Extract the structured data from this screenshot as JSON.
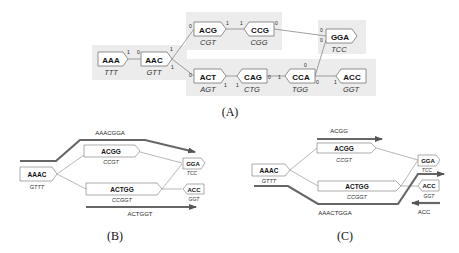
{
  "panel_a": {
    "caption": "(A)",
    "nodes": [
      {
        "id": "AAA",
        "label": "AAA",
        "sub": "TTT",
        "x": 98,
        "y": 52,
        "dir": "right"
      },
      {
        "id": "AAC",
        "label": "AAC",
        "sub": "GTT",
        "x": 141,
        "y": 52,
        "dir": "right"
      },
      {
        "id": "ACG",
        "label": "ACG",
        "sub": "CGT",
        "x": 194,
        "y": 22,
        "dir": "right"
      },
      {
        "id": "CCG",
        "label": "CCG",
        "sub": "CGG",
        "x": 244,
        "y": 22,
        "dir": "left"
      },
      {
        "id": "GGA",
        "label": "GGA",
        "sub": "TCC",
        "x": 326,
        "y": 29,
        "dir": "right"
      },
      {
        "id": "ACT",
        "label": "ACT",
        "sub": "AGT",
        "x": 194,
        "y": 69,
        "dir": "right"
      },
      {
        "id": "CAG",
        "label": "CAG",
        "sub": "CTG",
        "x": 237,
        "y": 69,
        "dir": "left"
      },
      {
        "id": "CCA",
        "label": "CCA",
        "sub": "TGG",
        "x": 285,
        "y": 69,
        "dir": "left"
      },
      {
        "id": "ACC",
        "label": "ACC",
        "sub": "GGT",
        "x": 336,
        "y": 69,
        "dir": "left"
      }
    ],
    "port_labels": [
      "1",
      "0",
      "1",
      "1",
      "0",
      "1",
      "1",
      "0",
      "0",
      "0",
      "0",
      "1",
      "1",
      "0",
      "1",
      "0",
      "1",
      "0"
    ]
  },
  "panel_b": {
    "caption": "(B)",
    "nodes": [
      {
        "label": "AAAC",
        "sub": "GTTT"
      },
      {
        "label": "ACGG",
        "sub": "CCGT"
      },
      {
        "label": "ACTGG",
        "sub": "CCGGT"
      },
      {
        "label": "GGA",
        "sub": "TCC"
      },
      {
        "label": "ACC",
        "sub": "GGT"
      }
    ],
    "paths": [
      {
        "label": "AAACGGA"
      },
      {
        "label": "ACTGGT"
      }
    ]
  },
  "panel_c": {
    "caption": "(C)",
    "nodes": [
      {
        "label": "AAAC",
        "sub": "GTTT"
      },
      {
        "label": "ACGG",
        "sub": "CCGT"
      },
      {
        "label": "ACTGG",
        "sub": "CCGGT"
      },
      {
        "label": "GGA",
        "sub": "TCC"
      },
      {
        "label": "ACC",
        "sub": "GGT"
      }
    ],
    "paths": [
      {
        "label": "ACGG"
      },
      {
        "label": "AAACTGGA"
      },
      {
        "label": "ACC"
      }
    ]
  }
}
